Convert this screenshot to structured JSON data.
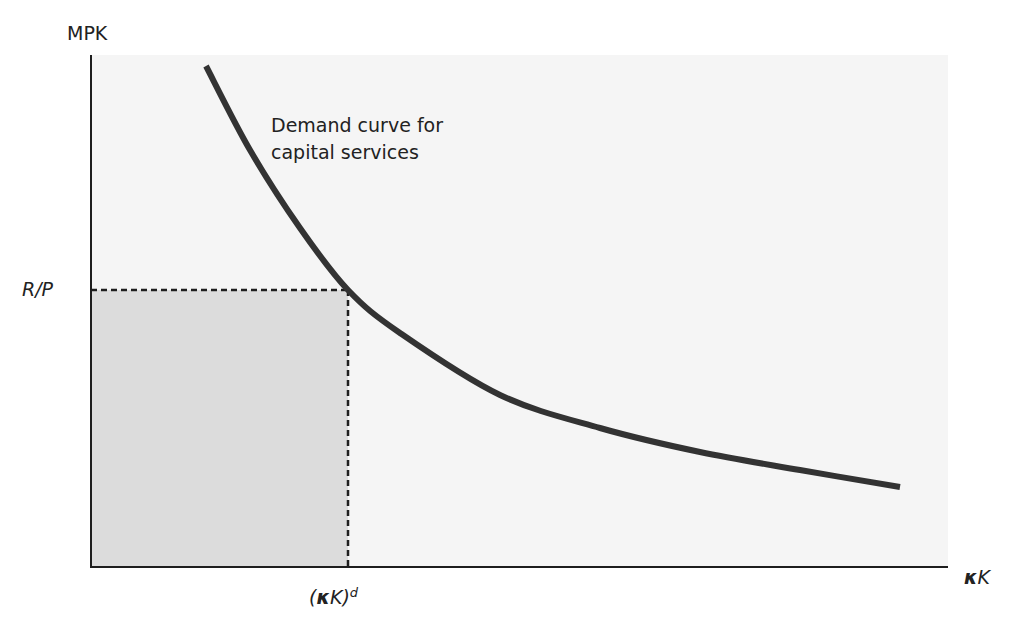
{
  "chart_data": {
    "type": "line",
    "title": "",
    "ylabel": "MPK",
    "xlabel": "κK",
    "xlabel_parts": {
      "kappa": "κ",
      "k": "K"
    },
    "grid": false,
    "series": [
      {
        "name": "Demand curve for capital services",
        "color": "#333333",
        "points_px": [
          [
            206,
            66
          ],
          [
            250,
            150
          ],
          [
            300,
            228
          ],
          [
            348,
            290
          ],
          [
            400,
            333
          ],
          [
            500,
            395
          ],
          [
            600,
            428
          ],
          [
            700,
            452
          ],
          [
            800,
            470
          ],
          [
            900,
            487
          ]
        ]
      }
    ],
    "reference": {
      "y_label": "R/P",
      "x_label": "(κK)^d",
      "x_label_parts": {
        "open": "(",
        "kappa": "κ",
        "k": "K",
        "close": ")",
        "sup": "d"
      },
      "shaded_region": "rectangle from origin to ((κK)^d, R/P)"
    },
    "annotation": [
      "Demand curve for",
      "capital services"
    ]
  },
  "colors": {
    "plot_background": "#f5f5f5",
    "shaded": "#dcdcdc",
    "curve": "#333333",
    "axis": "#1e1e1e"
  }
}
